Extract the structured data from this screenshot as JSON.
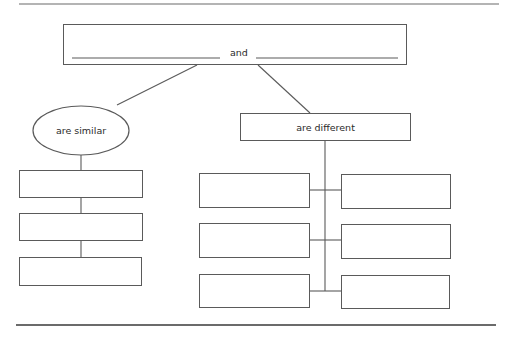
{
  "diagram": {
    "type": "compare-contrast graphic organizer",
    "top_box": {
      "blank_1": "",
      "connector_word": "and",
      "blank_2": ""
    },
    "similar_node": {
      "label": "are similar",
      "shape": "ellipse"
    },
    "different_node": {
      "label": "are different",
      "shape": "rectangle"
    },
    "similar_boxes": [
      "",
      "",
      ""
    ],
    "different_boxes": {
      "left": [
        "",
        "",
        ""
      ],
      "right": [
        "",
        "",
        ""
      ]
    }
  },
  "colors": {
    "line": "#5a5a5a",
    "text": "#2b2b2b",
    "background": "#ffffff"
  }
}
